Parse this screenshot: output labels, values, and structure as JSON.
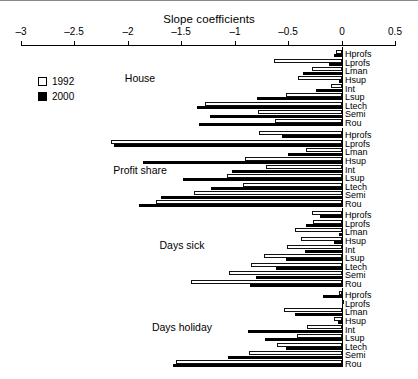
{
  "chart_data": {
    "type": "bar",
    "orientation": "horizontal",
    "title": "Slope coefficients",
    "xlabel": "",
    "ylabel": "",
    "xlim": [
      -3,
      0.5
    ],
    "xticks": [
      -3,
      -2.5,
      -2,
      -1.5,
      -1,
      -0.5,
      0,
      0.5
    ],
    "xticklabels": [
      "–3",
      "–2.5",
      "–2",
      "–1.5",
      "–1",
      "–0.5",
      "0",
      "0.5"
    ],
    "grid": false,
    "legend": {
      "position": "upper-left",
      "entries": [
        {
          "name": "1992",
          "fill": "#ffffff",
          "edge": "#000000"
        },
        {
          "name": "2000",
          "fill": "#000000",
          "edge": "#000000"
        }
      ]
    },
    "categories": [
      "Hprofs",
      "Lprofs",
      "Lman",
      "Hsup",
      "Int",
      "Lsup",
      "Ltech",
      "Semi",
      "Rou"
    ],
    "groups": [
      {
        "name": "House",
        "series": [
          {
            "name": "1992",
            "values": [
              -0.05,
              -0.63,
              -0.28,
              -0.41,
              -0.1,
              -0.52,
              -1.28,
              -0.78,
              -0.62
            ]
          },
          {
            "name": "2000",
            "values": [
              -0.07,
              -0.12,
              -0.36,
              -0.02,
              -0.24,
              -0.79,
              -1.35,
              -1.23,
              -1.33
            ]
          }
        ]
      },
      {
        "name": "Profit share",
        "series": [
          {
            "name": "1992",
            "values": [
              -0.77,
              -2.16,
              -0.33,
              -0.9,
              -0.71,
              -1.07,
              -0.92,
              -1.38,
              -1.74
            ]
          },
          {
            "name": "2000",
            "values": [
              -0.56,
              -2.13,
              -0.5,
              -1.86,
              -1.03,
              -1.48,
              -1.22,
              -1.69,
              -1.9
            ]
          }
        ]
      },
      {
        "name": "Days sick",
        "series": [
          {
            "name": "1992",
            "values": [
              -0.28,
              -0.27,
              -0.44,
              -0.38,
              -0.51,
              -0.73,
              -0.85,
              -1.05,
              -1.41
            ]
          },
          {
            "name": "2000",
            "values": [
              -0.2,
              -0.33,
              -0.02,
              -0.07,
              -0.34,
              -0.52,
              -0.61,
              -0.8,
              -0.86
            ]
          }
        ]
      },
      {
        "name": "Days holiday",
        "series": [
          {
            "name": "1992",
            "values": [
              -0.02,
              0.02,
              -0.54,
              -0.07,
              -0.32,
              -0.42,
              -0.6,
              -0.87,
              -1.55
            ]
          },
          {
            "name": "2000",
            "values": [
              -0.17,
              0.0,
              -0.44,
              -0.03,
              -0.88,
              -0.72,
              -0.52,
              -1.06,
              -1.58
            ]
          }
        ]
      }
    ]
  },
  "labels": {
    "group_house": "House",
    "group_profit": "Profit share",
    "group_sick": "Days sick",
    "group_holiday": "Days holiday",
    "legend_1992": "1992",
    "legend_2000": "2000",
    "title": "Slope coefficients",
    "cat_hprofs": "Hprofs",
    "cat_lprofs": "Lprofs",
    "cat_lman": "Lman",
    "cat_hsup": "Hsup",
    "cat_int": "Int",
    "cat_lsup": "Lsup",
    "cat_ltech": "Ltech",
    "cat_semi": "Semi",
    "cat_rou": "Rou"
  }
}
